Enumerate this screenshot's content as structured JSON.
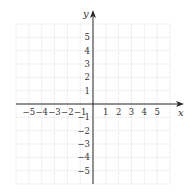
{
  "chart_data": {
    "type": "scatter",
    "title": "",
    "xlabel": "x",
    "ylabel": "y",
    "xlim": [
      -6,
      6
    ],
    "ylim": [
      -6,
      6
    ],
    "grid": true,
    "x_ticks": [
      -5,
      -4,
      -3,
      -2,
      -1,
      1,
      2,
      3,
      4,
      5
    ],
    "y_ticks": [
      5,
      4,
      3,
      2,
      1,
      -1,
      -2,
      -3,
      -4,
      -5
    ],
    "x_tick_labels": [
      "−5",
      "−4",
      "−3",
      "−2",
      "−1",
      "1",
      "2",
      "3",
      "4",
      "5"
    ],
    "y_tick_labels": [
      "5",
      "4",
      "3",
      "2",
      "1",
      "−1",
      "−2",
      "−3",
      "−4",
      "−5"
    ],
    "series": [],
    "legend": null
  },
  "colors": {
    "grid": "#d6d6d6",
    "axis": "#2a2a2a",
    "text": "#333333"
  }
}
